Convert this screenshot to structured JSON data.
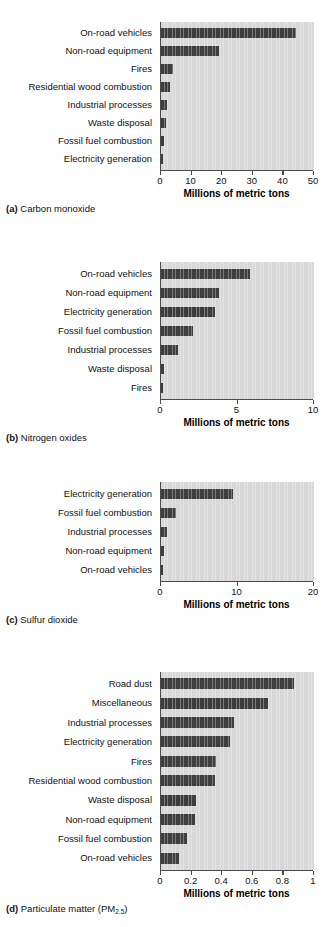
{
  "figure": {
    "xlabel": "Millions of metric tons",
    "bar_color": "#3e3e3e",
    "plot_bg_color": "#d8d8d8",
    "axis_color": "#4a4a4a"
  },
  "panels": [
    {
      "id": "a",
      "letter": "(a)",
      "caption": "Carbon monoxide",
      "caption_full": "(a) Carbon monoxide"
    },
    {
      "id": "b",
      "letter": "(b)",
      "caption": "Nitrogen oxides",
      "caption_full": "(b) Nitrogen oxides"
    },
    {
      "id": "c",
      "letter": "(c)",
      "caption": "Sulfur dioxide",
      "caption_full": "(c) Sulfur dioxide"
    },
    {
      "id": "d",
      "letter": "(d)",
      "caption_prefix": "Particulate matter (PM",
      "caption_sub": "2.5",
      "caption_suffix": ")",
      "caption_full": "(d) Particulate matter (PM2.5)"
    }
  ],
  "chart_data": [
    {
      "type": "bar",
      "orientation": "horizontal",
      "panel": "a",
      "title": "(a) Carbon monoxide",
      "xlabel": "Millions of metric tons",
      "ylabel": "",
      "xlim": [
        0,
        50
      ],
      "xticks": [
        0,
        10,
        20,
        30,
        40,
        50
      ],
      "xticklabels": [
        "0",
        "10",
        "20",
        "30",
        "40",
        "50"
      ],
      "grid": false,
      "legend": "none",
      "categories": [
        "On-road vehicles",
        "Non-road equipment",
        "Fires",
        "Residential wood combustion",
        "Industrial processes",
        "Waste disposal",
        "Fossil fuel combustion",
        "Electricity generation"
      ],
      "values": [
        44.0,
        18.8,
        3.9,
        2.8,
        2.0,
        1.5,
        1.1,
        0.6
      ]
    },
    {
      "type": "bar",
      "orientation": "horizontal",
      "panel": "b",
      "title": "(b) Nitrogen oxides",
      "xlabel": "Millions of metric tons",
      "ylabel": "",
      "xlim": [
        0,
        10
      ],
      "xticks": [
        0,
        5,
        10
      ],
      "xticklabels": [
        "0",
        "5",
        "10"
      ],
      "grid": false,
      "legend": "none",
      "categories": [
        "On-road vehicles",
        "Non-road equipment",
        "Electricity generation",
        "Fossil fuel combustion",
        "Industrial processes",
        "Waste disposal",
        "Fires"
      ],
      "values": [
        5.8,
        3.8,
        3.5,
        2.1,
        1.1,
        0.2,
        0.1
      ]
    },
    {
      "type": "bar",
      "orientation": "horizontal",
      "panel": "c",
      "title": "(c) Sulfur dioxide",
      "xlabel": "Millions of metric tons",
      "ylabel": "",
      "xlim": [
        0,
        20
      ],
      "xticks": [
        0,
        10,
        20
      ],
      "xticklabels": [
        "0",
        "10",
        "20"
      ],
      "grid": false,
      "legend": "none",
      "categories": [
        "Electricity generation",
        "Fossil fuel combustion",
        "Industrial processes",
        "Non-road equipment",
        "On-road vehicles"
      ],
      "values": [
        9.4,
        1.9,
        0.8,
        0.4,
        0.2
      ]
    },
    {
      "type": "bar",
      "orientation": "horizontal",
      "panel": "d",
      "title": "(d) Particulate matter (PM2.5)",
      "xlabel": "Millions of metric tons",
      "ylabel": "",
      "xlim": [
        0,
        1
      ],
      "xticks": [
        0,
        0.2,
        0.4,
        0.6,
        0.8,
        1
      ],
      "xticklabels": [
        "0",
        "0.2",
        "0.4",
        "0.6",
        "0.8",
        "1"
      ],
      "grid": false,
      "legend": "none",
      "categories": [
        "Road dust",
        "Miscellaneous",
        "Industrial processes",
        "Electricity generation",
        "Fires",
        "Residential wood combustion",
        "Waste disposal",
        "Non-road equipment",
        "Fossil fuel combustion",
        "On-road vehicles"
      ],
      "values": [
        0.87,
        0.7,
        0.48,
        0.45,
        0.36,
        0.35,
        0.23,
        0.22,
        0.17,
        0.12
      ]
    }
  ]
}
